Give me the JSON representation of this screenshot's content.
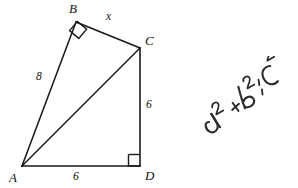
{
  "figure": {
    "background_color": "#ffffff",
    "line_color": "#1a1a1a",
    "vertices": [
      {
        "id": "A",
        "label": "A",
        "x": 22,
        "y": 166,
        "label_x": 9,
        "label_y": 182
      },
      {
        "id": "B",
        "label": "B",
        "x": 76,
        "y": 22,
        "label_x": 69,
        "label_y": 13
      },
      {
        "id": "C",
        "label": "C",
        "x": 140,
        "y": 48,
        "label_x": 145,
        "label_y": 45
      },
      {
        "id": "D",
        "label": "D",
        "x": 140,
        "y": 166,
        "label_x": 145,
        "label_y": 180
      }
    ],
    "segments": [
      {
        "id": "AB",
        "from": "A",
        "to": "B",
        "x1": 22,
        "y1": 166,
        "x2": 76,
        "y2": 22
      },
      {
        "id": "BC",
        "from": "B",
        "to": "C",
        "x1": 76,
        "y1": 22,
        "x2": 140,
        "y2": 48
      },
      {
        "id": "CD",
        "from": "C",
        "to": "D",
        "x1": 140,
        "y1": 48,
        "x2": 140,
        "y2": 166
      },
      {
        "id": "AD",
        "from": "A",
        "to": "D",
        "x1": 22,
        "y1": 166,
        "x2": 140,
        "y2": 166
      },
      {
        "id": "AC",
        "from": "A",
        "to": "C",
        "x1": 22,
        "y1": 166,
        "x2": 140,
        "y2": 48
      }
    ],
    "side_labels": [
      {
        "id": "AB",
        "text": "8",
        "x": 36,
        "y": 80
      },
      {
        "id": "BC",
        "text": "x",
        "x": 106,
        "y": 20
      },
      {
        "id": "CD",
        "text": "6",
        "x": 146,
        "y": 108
      },
      {
        "id": "AD",
        "text": "6",
        "x": 73,
        "y": 180
      }
    ],
    "right_angles": [
      {
        "id": "angle-B",
        "at": "B",
        "points": "69.6,30.6 78.8,38.4 86.6,29.2 77.4,21.4"
      },
      {
        "id": "angle-D",
        "at": "D",
        "points": "128.5,154.5 140,154.5 140,166 128.5,166"
      }
    ]
  },
  "annotation": {
    "id": "pythagorean-theorem-note",
    "text": "a² + b² = c²",
    "style": "handwritten",
    "rotation_degrees": -30,
    "color": "#2b2b2b"
  }
}
